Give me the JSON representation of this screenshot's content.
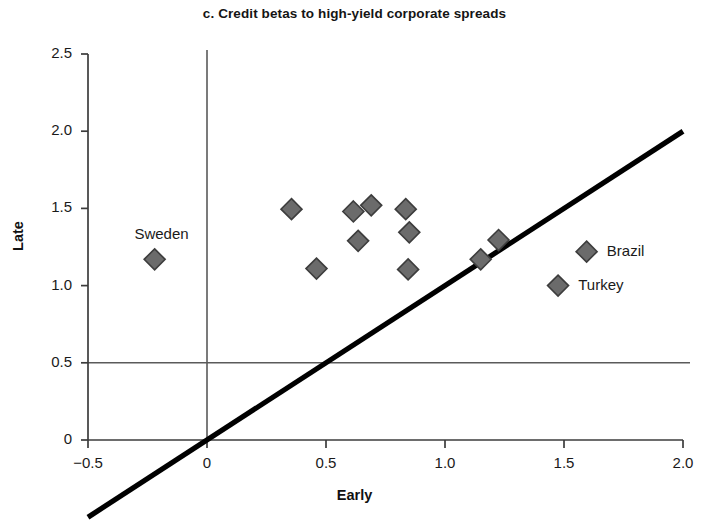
{
  "chart_data": {
    "type": "scatter",
    "title": "c. Credit betas to high-yield corporate spreads",
    "xlabel": "Early",
    "ylabel": "Late",
    "xlim": [
      -0.5,
      2.0
    ],
    "ylim": [
      0,
      2.5
    ],
    "xticks": [
      "−0.5",
      "0",
      "0.5",
      "1.0",
      "1.5",
      "2.0"
    ],
    "xtick_values": [
      -0.5,
      0,
      0.5,
      1.0,
      1.5,
      2.0
    ],
    "yticks": [
      "0",
      "0.5",
      "1.0",
      "1.5",
      "2.0",
      "2.5"
    ],
    "ytick_values": [
      0,
      0.5,
      1.0,
      1.5,
      2.0,
      2.5
    ],
    "grid": "reference lines at x=0 and y=0.5",
    "reference_lines": [
      {
        "name": "vertical-zero-line",
        "type": "vertical",
        "value": 0
      },
      {
        "name": "horizontal-half-line",
        "type": "horizontal",
        "value": 0.5
      },
      {
        "name": "forty-five-degree-line",
        "type": "identity",
        "from": [
          -0.5,
          -0.5
        ],
        "to": [
          2.0,
          2.0
        ]
      }
    ],
    "marker": "diamond",
    "marker_color": "#6b6b6b",
    "marker_edge_color": "#3a3a3a",
    "points": [
      {
        "label": "Sweden",
        "x": -0.22,
        "y": 1.17
      },
      {
        "label": "",
        "x": 0.355,
        "y": 1.495
      },
      {
        "label": "",
        "x": 0.46,
        "y": 1.11
      },
      {
        "label": "",
        "x": 0.615,
        "y": 1.48
      },
      {
        "label": "",
        "x": 0.635,
        "y": 1.29
      },
      {
        "label": "",
        "x": 0.69,
        "y": 1.52
      },
      {
        "label": "",
        "x": 0.835,
        "y": 1.495
      },
      {
        "label": "",
        "x": 0.85,
        "y": 1.345
      },
      {
        "label": "",
        "x": 0.845,
        "y": 1.105
      },
      {
        "label": "",
        "x": 1.15,
        "y": 1.17
      },
      {
        "label": "",
        "x": 1.225,
        "y": 1.295
      },
      {
        "label": "Brazil",
        "x": 1.595,
        "y": 1.22
      },
      {
        "label": "Turkey",
        "x": 1.475,
        "y": 1.0
      }
    ],
    "annotations": [
      {
        "name": "sweden-label",
        "text": "Sweden",
        "x": -0.305,
        "y": 1.33
      },
      {
        "name": "brazil-label",
        "text": "Brazil",
        "x": 1.68,
        "y": 1.22
      },
      {
        "name": "turkey-label",
        "text": "Turkey",
        "x": 1.56,
        "y": 1.0
      }
    ]
  },
  "colors": {
    "marker_fill": "#6b6b6b",
    "marker_stroke": "#3d3d3d",
    "axis": "#3c3c3c",
    "reference_line": "#5a5a5a",
    "diagonal_line": "#000000",
    "text": "#1a1a1a",
    "background": "#ffffff"
  }
}
